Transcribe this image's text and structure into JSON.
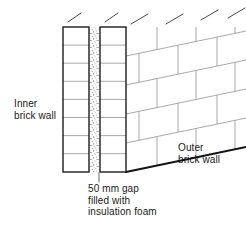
{
  "diagram": {
    "type": "cavity-wall-cutaway",
    "labels": {
      "inner_wall": "Inner\nbrick wall",
      "outer_wall": "Outer\nbrick wall",
      "gap_caption": "50 mm gap\nfilled with\ninsulation foam"
    },
    "measurements": {
      "gap_width": "50 mm",
      "gap_fill": "insulation foam"
    },
    "colors": {
      "outline": "#1a1a1a",
      "mortar_line": "#9a9a9a",
      "foam_fill": "#c9c9c9",
      "background": "#ffffff",
      "text": "#1a1a1a"
    },
    "geometry": {
      "inner_section": {
        "x": 63,
        "y": 27,
        "width": 26,
        "height": 145,
        "courses": 8
      },
      "outer_section": {
        "x": 100,
        "y": 27,
        "width": 26,
        "height": 145,
        "courses": 8
      },
      "cavity_gap": {
        "x": 89,
        "y": 27,
        "width": 11,
        "height": 145
      },
      "outer_face": {
        "left": 126,
        "top": 27,
        "right": 246,
        "bottom": 172,
        "courses": 5
      },
      "leader_line": {
        "x": 99,
        "y1": 172,
        "y2": 182
      }
    }
  }
}
